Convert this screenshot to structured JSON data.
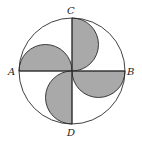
{
  "diagram": {
    "labels": {
      "A": "A",
      "B": "B",
      "C": "C",
      "D": "D"
    },
    "colors": {
      "stroke": "#2a2a2a",
      "shade": "#a9a9a9",
      "background": "#ffffff"
    }
  }
}
